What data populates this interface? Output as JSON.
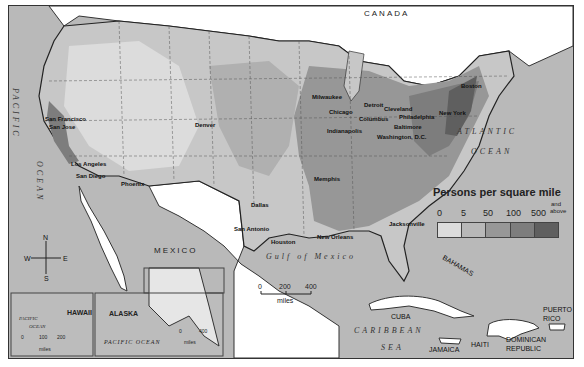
{
  "map": {
    "title": "Population density of the United States",
    "countries": {
      "canada": "CANADA",
      "mexico": "MEXICO"
    },
    "water_bodies": {
      "pacific_1": "PACIFIC",
      "pacific_2": "OCEAN",
      "atlantic_1": "ATLANTIC",
      "atlantic_2": "OCEAN",
      "gulf": "Gulf of Mexico",
      "caribbean_1": "CARIBBEAN",
      "caribbean_2": "SEA"
    },
    "cities": [
      {
        "name": "San Francisco"
      },
      {
        "name": "San Jose"
      },
      {
        "name": "Los Angeles"
      },
      {
        "name": "San Diego"
      },
      {
        "name": "Phoenix"
      },
      {
        "name": "Denver"
      },
      {
        "name": "Dallas"
      },
      {
        "name": "San Antonio"
      },
      {
        "name": "Houston"
      },
      {
        "name": "New Orleans"
      },
      {
        "name": "Memphis"
      },
      {
        "name": "Jacksonville"
      },
      {
        "name": "Milwaukee"
      },
      {
        "name": "Chicago"
      },
      {
        "name": "Detroit"
      },
      {
        "name": "Cleveland"
      },
      {
        "name": "Columbus"
      },
      {
        "name": "Indianapolis"
      },
      {
        "name": "Philadelphia"
      },
      {
        "name": "Baltimore"
      },
      {
        "name": "Washington, D.C."
      },
      {
        "name": "New York"
      },
      {
        "name": "Boston"
      }
    ],
    "islands": {
      "bahamas": "BAHAMAS",
      "cuba": "CUBA",
      "jamaica": "JAMAICA",
      "haiti": "HAITI",
      "dominican_1": "DOMINICAN",
      "dominican_2": "REPUBLIC",
      "puerto_1": "PUERTO",
      "puerto_2": "RICO"
    },
    "compass": {
      "n": "N",
      "s": "S",
      "e": "E",
      "w": "W"
    },
    "scale_main": {
      "ticks": [
        "0",
        "200",
        "400"
      ],
      "unit": "miles"
    },
    "inset_hawaii": {
      "label": "HAWAII",
      "ocean_1": "PACIFIC",
      "ocean_2": "OCEAN",
      "scale_ticks": [
        "0",
        "100",
        "200"
      ],
      "unit": "miles"
    },
    "inset_alaska": {
      "label": "ALASKA",
      "ocean": "PACIFIC   OCEAN",
      "scale_ticks": [
        "0",
        "400"
      ],
      "unit": "miles"
    }
  },
  "legend": {
    "title": "Persons per square mile",
    "ticks": [
      "0",
      "5",
      "50",
      "100",
      "500"
    ],
    "last_tick_1": "and",
    "last_tick_2": "above",
    "colors": [
      "#dcdcdc",
      "#b8b8b8",
      "#979797",
      "#7d7d7d",
      "#5f5f5f"
    ]
  },
  "colors": {
    "water": "#b9b9b9",
    "foreign_land": "#ffffff",
    "border": "#333333"
  }
}
